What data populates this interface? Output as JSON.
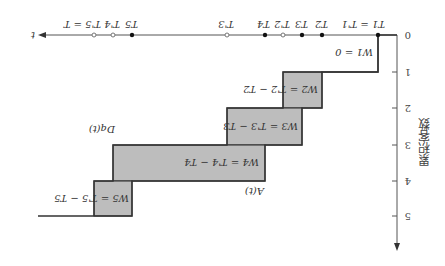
{
  "diagram": {
    "rotation_deg": 180,
    "y_axis": {
      "label": "累积客数",
      "ticks": [
        "0",
        "1",
        "2",
        "3",
        "4",
        "5"
      ]
    },
    "x_axis": {
      "label": "t"
    },
    "arrival_points": [
      {
        "label": "T1 = T'1",
        "kind": "filled"
      },
      {
        "label": "T2",
        "kind": "filled"
      },
      {
        "label": "T3",
        "kind": "filled"
      },
      {
        "label": "T4",
        "kind": "filled"
      },
      {
        "label": "T5",
        "kind": "filled"
      }
    ],
    "departure_points": [
      {
        "label": "T'2",
        "kind": "hollow"
      },
      {
        "label": "T'3",
        "kind": "hollow"
      },
      {
        "label": "T'4",
        "kind": "hollow"
      },
      {
        "label": "T'5 = T",
        "kind": "hollow"
      }
    ],
    "curves": {
      "arrival": "A(t)",
      "departure": "Dq(t)"
    },
    "waits": [
      {
        "label": "W1 = 0"
      },
      {
        "label": "W2 = T'2 − T2"
      },
      {
        "label": "W3 = T'3 − T3"
      },
      {
        "label": "W4 = T'4 − T4"
      },
      {
        "label": "W5 = T'5 − T5"
      }
    ],
    "colors": {
      "wait_fill": "#bdbdbd",
      "line": "#333333"
    }
  }
}
